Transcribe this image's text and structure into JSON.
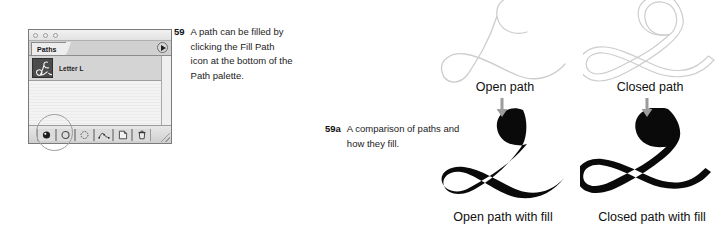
{
  "palette": {
    "window_dots": [
      "dot-1",
      "dot-2",
      "dot-3"
    ],
    "tab_label": "Paths",
    "menu_icon": "palette-menu-triangle-icon",
    "path_row": {
      "thumbnail_icon": "path-thumbnail-letter-l",
      "name": "Letter L"
    },
    "toolbar_buttons": [
      {
        "name": "fill-path-button",
        "icon": "fill-path-icon",
        "title": "Fill path with foreground color"
      },
      {
        "name": "stroke-path-button",
        "icon": "stroke-path-icon",
        "title": "Stroke path with brush"
      },
      {
        "name": "load-selection-button",
        "icon": "load-path-as-selection-icon",
        "title": "Load path as a selection"
      },
      {
        "name": "make-work-path-button",
        "icon": "make-work-path-from-selection-icon",
        "title": "Make work path from selection"
      },
      {
        "name": "new-path-button",
        "icon": "new-path-page-icon",
        "title": "Create new path"
      },
      {
        "name": "delete-path-button",
        "icon": "trash-can-icon",
        "title": "Delete current path"
      }
    ],
    "resize_grip_icon": "resize-grip-icon",
    "highlight_annotation": "fill-path-highlight-circle"
  },
  "captions": [
    {
      "number": "59",
      "text": "A path can be filled by clicking the Fill Path icon at the bottom of the Path palette."
    },
    {
      "number": "59a",
      "text": "A comparison of paths and how they fill."
    }
  ],
  "figures": {
    "open_path": {
      "label": "Open path",
      "artwork": "open-script-l-path-outline",
      "arrow_icon": "down-arrow-icon"
    },
    "closed_path": {
      "label": "Closed path",
      "artwork": "closed-script-l-path-outline",
      "arrow_icon": "down-arrow-icon"
    },
    "open_path_with_fill": {
      "label": "Open path with fill",
      "artwork": "open-script-l-filled-black"
    },
    "closed_path_with_fill": {
      "label": "Closed path with fill",
      "artwork": "closed-script-l-filled-black"
    }
  },
  "colors": {
    "page_background": "#ffffff",
    "text": "#1a1a1a",
    "path_outline": "#c9c9c9",
    "fill_black": "#0a0a0a",
    "arrow_gray": "#9a9a9a",
    "palette_chrome": "#e8e8e8",
    "palette_row_selected": "#d4d4d4"
  }
}
